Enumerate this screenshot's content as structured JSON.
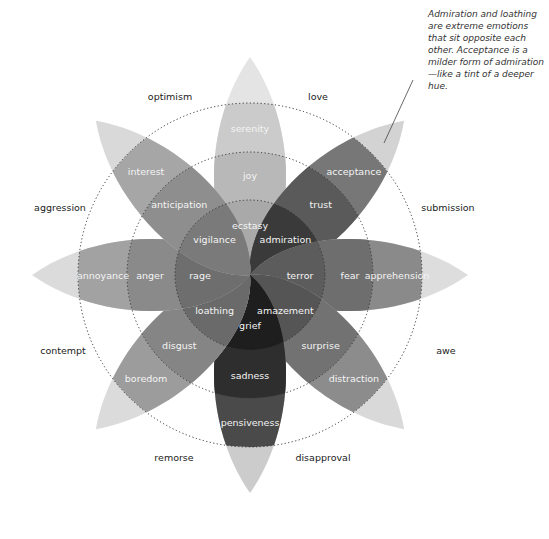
{
  "annotation": {
    "text": "Admiration and loathing are extreme emotions that sit opposite each other. Acceptance is a milder form of admiration—like a tint of a deeper hue."
  },
  "colors": {
    "ring_stroke": "#333333",
    "label_light": "#f4f4f4",
    "label_dark": "#222222",
    "background": "#ffffff"
  },
  "wheel": {
    "center": [
      250,
      275
    ],
    "ring_radii": [
      75,
      123,
      172
    ],
    "petals": [
      {
        "angle": 0,
        "inner": "ecstasy",
        "middle": "joy",
        "outer": "serenity",
        "shades": [
          "#a9a9a9",
          "#b8b8b8",
          "#cbcbcb",
          "#e2e2e2"
        ]
      },
      {
        "angle": 45,
        "inner": "admiration",
        "middle": "trust",
        "outer": "acceptance",
        "shades": [
          "#3a3a3a",
          "#5a5a5a",
          "#777777",
          "#cfcfcf"
        ]
      },
      {
        "angle": 90,
        "inner": "terror",
        "middle": "fear",
        "outer": "apprehension",
        "shades": [
          "#5c5c5c",
          "#6e6e6e",
          "#8a8a8a",
          "#dadada"
        ]
      },
      {
        "angle": 135,
        "inner": "amazement",
        "middle": "surprise",
        "outer": "distraction",
        "shades": [
          "#555555",
          "#727272",
          "#8c8c8c",
          "#d6d6d6"
        ]
      },
      {
        "angle": 180,
        "inner": "grief",
        "middle": "sadness",
        "outer": "pensiveness",
        "shades": [
          "#1e1e1e",
          "#2e2e2e",
          "#4a4a4a",
          "#c8c8c8"
        ]
      },
      {
        "angle": 225,
        "inner": "loathing",
        "middle": "disgust",
        "outer": "boredom",
        "shades": [
          "#6a6a6a",
          "#858585",
          "#9c9c9c",
          "#d8d8d8"
        ]
      },
      {
        "angle": 270,
        "inner": "rage",
        "middle": "anger",
        "outer": "annoyance",
        "shades": [
          "#6e6e6e",
          "#8a8a8a",
          "#a2a2a2",
          "#d8d8d8"
        ]
      },
      {
        "angle": 315,
        "inner": "vigilance",
        "middle": "anticipation",
        "outer": "interest",
        "shades": [
          "#7a7a7a",
          "#8e8e8e",
          "#a6a6a6",
          "#d6d6d6"
        ]
      }
    ],
    "dyads": [
      {
        "label": "love",
        "x": 318,
        "y": 100
      },
      {
        "label": "submission",
        "x": 448,
        "y": 211
      },
      {
        "label": "awe",
        "x": 446,
        "y": 354
      },
      {
        "label": "disapproval",
        "x": 323,
        "y": 461
      },
      {
        "label": "remorse",
        "x": 174,
        "y": 461
      },
      {
        "label": "contempt",
        "x": 63,
        "y": 354
      },
      {
        "label": "aggression",
        "x": 60,
        "y": 211
      },
      {
        "label": "optimism",
        "x": 170,
        "y": 100
      }
    ]
  }
}
